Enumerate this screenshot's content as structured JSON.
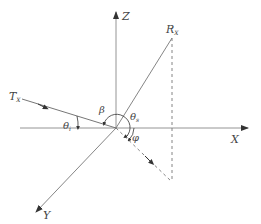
{
  "diagram": {
    "axes": {
      "x_label": "X",
      "y_label": "Y",
      "z_label": "Z"
    },
    "transmitter": {
      "label": "T",
      "subscript": "X"
    },
    "receiver": {
      "label": "R",
      "subscript": "X"
    },
    "angles": {
      "incidence": {
        "symbol": "θ",
        "subscript": "i"
      },
      "bistatic": {
        "symbol": "β"
      },
      "scattering": {
        "symbol": "θ",
        "subscript": "s"
      },
      "azimuth": {
        "symbol": "φ"
      }
    },
    "colors": {
      "line": "#555555",
      "text": "#444444",
      "background": "#ffffff"
    }
  }
}
